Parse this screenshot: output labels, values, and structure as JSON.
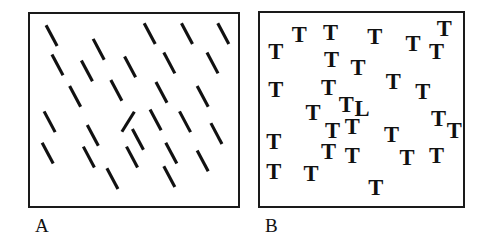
{
  "figure": {
    "background_color": "#ffffff",
    "ink_color": "#111111",
    "border_color": "#1a1a1a",
    "panel_count": 2
  },
  "panels": [
    {
      "id": "panel-a",
      "label": "A",
      "name": "line-orientation-search-panel",
      "search_type": "feature search",
      "distractor_description": "line tilted down-to-the-right",
      "target_description": "line tilted up-to-the-right",
      "distractor_angle_deg": 62,
      "target_angle_deg": -58,
      "item_count": 28,
      "target_count": 1,
      "line_length": 24,
      "line_width": 3.2
    },
    {
      "id": "panel-b",
      "label": "B",
      "name": "letter-conjunction-search-panel",
      "search_type": "serial search",
      "distractor_description": "letter T",
      "target_description": "letter L",
      "distractor_glyph": "T",
      "target_glyph": "L",
      "item_count": 29,
      "target_count": 1,
      "glyph_font_size": 23
    }
  ],
  "chart_data": {
    "type": "scatter",
    "title": "",
    "subtitle": "",
    "xlabel": "",
    "ylabel": "",
    "grid": false,
    "legend": "none",
    "panel_a": {
      "label": "A",
      "xlim": [
        0,
        212
      ],
      "ylim": [
        0,
        196
      ],
      "distractor_angle_deg": 62,
      "target_angle_deg": -58,
      "length": 24,
      "items": [
        {
          "x": 22,
          "y": 22,
          "angle": 62,
          "target": false
        },
        {
          "x": 70,
          "y": 36,
          "angle": 62,
          "target": false
        },
        {
          "x": 122,
          "y": 20,
          "angle": 62,
          "target": false
        },
        {
          "x": 160,
          "y": 20,
          "angle": 62,
          "target": false
        },
        {
          "x": 197,
          "y": 20,
          "angle": 62,
          "target": false
        },
        {
          "x": 28,
          "y": 52,
          "angle": 62,
          "target": false
        },
        {
          "x": 58,
          "y": 58,
          "angle": 62,
          "target": false
        },
        {
          "x": 102,
          "y": 54,
          "angle": 62,
          "target": false
        },
        {
          "x": 142,
          "y": 50,
          "angle": 62,
          "target": false
        },
        {
          "x": 186,
          "y": 50,
          "angle": 62,
          "target": false
        },
        {
          "x": 46,
          "y": 84,
          "angle": 62,
          "target": false
        },
        {
          "x": 88,
          "y": 78,
          "angle": 62,
          "target": false
        },
        {
          "x": 134,
          "y": 80,
          "angle": 62,
          "target": false
        },
        {
          "x": 176,
          "y": 84,
          "angle": 62,
          "target": false
        },
        {
          "x": 100,
          "y": 110,
          "angle": -58,
          "target": true
        },
        {
          "x": 20,
          "y": 110,
          "angle": 62,
          "target": false
        },
        {
          "x": 128,
          "y": 108,
          "angle": 62,
          "target": false
        },
        {
          "x": 158,
          "y": 110,
          "angle": 62,
          "target": false
        },
        {
          "x": 64,
          "y": 124,
          "angle": 62,
          "target": false
        },
        {
          "x": 110,
          "y": 128,
          "angle": 62,
          "target": false
        },
        {
          "x": 190,
          "y": 122,
          "angle": 62,
          "target": false
        },
        {
          "x": 18,
          "y": 142,
          "angle": 62,
          "target": false
        },
        {
          "x": 60,
          "y": 146,
          "angle": 62,
          "target": false
        },
        {
          "x": 104,
          "y": 146,
          "angle": 62,
          "target": false
        },
        {
          "x": 144,
          "y": 142,
          "angle": 62,
          "target": false
        },
        {
          "x": 176,
          "y": 150,
          "angle": 62,
          "target": false
        },
        {
          "x": 84,
          "y": 168,
          "angle": 62,
          "target": false
        },
        {
          "x": 142,
          "y": 166,
          "angle": 62,
          "target": false
        }
      ]
    },
    "panel_b": {
      "label": "B",
      "xlim": [
        0,
        207
      ],
      "ylim": [
        0,
        197
      ],
      "items": [
        {
          "x": 16,
          "y": 42,
          "glyph": "T",
          "target": false
        },
        {
          "x": 40,
          "y": 24,
          "glyph": "T",
          "target": false
        },
        {
          "x": 72,
          "y": 22,
          "glyph": "T",
          "target": false
        },
        {
          "x": 117,
          "y": 26,
          "glyph": "T",
          "target": false
        },
        {
          "x": 156,
          "y": 34,
          "glyph": "T",
          "target": false
        },
        {
          "x": 188,
          "y": 18,
          "glyph": "T",
          "target": false
        },
        {
          "x": 180,
          "y": 42,
          "glyph": "T",
          "target": false
        },
        {
          "x": 73,
          "y": 50,
          "glyph": "T",
          "target": false
        },
        {
          "x": 100,
          "y": 58,
          "glyph": "T",
          "target": false
        },
        {
          "x": 16,
          "y": 80,
          "glyph": "T",
          "target": false
        },
        {
          "x": 70,
          "y": 78,
          "glyph": "T",
          "target": false
        },
        {
          "x": 136,
          "y": 72,
          "glyph": "T",
          "target": false
        },
        {
          "x": 166,
          "y": 82,
          "glyph": "T",
          "target": false
        },
        {
          "x": 88,
          "y": 96,
          "glyph": "T",
          "target": false
        },
        {
          "x": 104,
          "y": 100,
          "glyph": "L",
          "target": true
        },
        {
          "x": 54,
          "y": 104,
          "glyph": "T",
          "target": false
        },
        {
          "x": 182,
          "y": 110,
          "glyph": "T",
          "target": false
        },
        {
          "x": 74,
          "y": 122,
          "glyph": "T",
          "target": false
        },
        {
          "x": 94,
          "y": 118,
          "glyph": "T",
          "target": false
        },
        {
          "x": 134,
          "y": 126,
          "glyph": "T",
          "target": false
        },
        {
          "x": 14,
          "y": 134,
          "glyph": "T",
          "target": false
        },
        {
          "x": 94,
          "y": 148,
          "glyph": "T",
          "target": false
        },
        {
          "x": 150,
          "y": 150,
          "glyph": "T",
          "target": false
        },
        {
          "x": 180,
          "y": 148,
          "glyph": "T",
          "target": false
        },
        {
          "x": 14,
          "y": 164,
          "glyph": "T",
          "target": false
        },
        {
          "x": 52,
          "y": 166,
          "glyph": "T",
          "target": false
        },
        {
          "x": 70,
          "y": 144,
          "glyph": "T",
          "target": false
        },
        {
          "x": 118,
          "y": 180,
          "glyph": "T",
          "target": false
        },
        {
          "x": 198,
          "y": 122,
          "glyph": "T",
          "target": false
        }
      ]
    }
  }
}
